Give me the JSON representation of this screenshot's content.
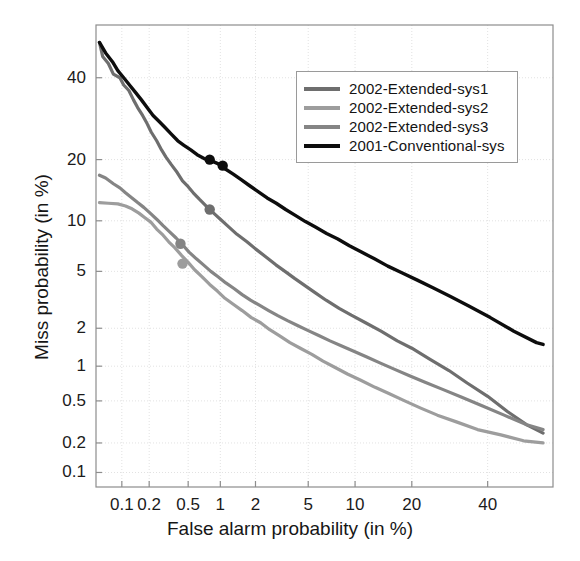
{
  "chart_data": {
    "type": "line",
    "title": "",
    "xlabel": "False alarm probability (in %)",
    "ylabel": "Miss probability (in %)",
    "scale": "normal-deviate (DET curve)",
    "grid": true,
    "legend_position": "upper-right-inside",
    "xticks": [
      "0.1",
      "0.2",
      "0.5",
      "1",
      "2",
      "5",
      "10",
      "20",
      "40"
    ],
    "xtick_values": [
      0.1,
      0.2,
      0.5,
      1,
      2,
      5,
      10,
      20,
      40
    ],
    "yticks": [
      "40",
      "20",
      "10",
      "5",
      "2",
      "1",
      "0.5",
      "0.2",
      "0.1"
    ],
    "ytick_values": [
      40,
      20,
      10,
      5,
      2,
      1,
      0.5,
      0.2,
      0.1
    ],
    "xlim": [
      0.05,
      60
    ],
    "ylim": [
      0.07,
      55
    ],
    "series": [
      {
        "name": "2002-Extended-sys1",
        "color": "#6e6e6e",
        "points": [
          [
            0.055,
            50.0
          ],
          [
            0.06,
            46.0
          ],
          [
            0.07,
            44.0
          ],
          [
            0.08,
            41.0
          ],
          [
            0.095,
            40.0
          ],
          [
            0.105,
            38.0
          ],
          [
            0.12,
            36.5
          ],
          [
            0.135,
            34.0
          ],
          [
            0.15,
            32.0
          ],
          [
            0.17,
            30.0
          ],
          [
            0.19,
            28.0
          ],
          [
            0.21,
            26.0
          ],
          [
            0.24,
            24.0
          ],
          [
            0.27,
            22.0
          ],
          [
            0.3,
            20.5
          ],
          [
            0.34,
            19.0
          ],
          [
            0.39,
            17.5
          ],
          [
            0.44,
            16.0
          ],
          [
            0.5,
            15.0
          ],
          [
            0.56,
            14.0
          ],
          [
            0.64,
            13.0
          ],
          [
            0.72,
            12.2
          ],
          [
            0.8,
            11.5
          ],
          [
            0.9,
            10.8
          ],
          [
            1.0,
            10.2
          ],
          [
            1.2,
            9.2
          ],
          [
            1.4,
            8.4
          ],
          [
            1.7,
            7.6
          ],
          [
            2.0,
            6.9
          ],
          [
            2.4,
            6.2
          ],
          [
            2.9,
            5.5
          ],
          [
            3.4,
            5.0
          ],
          [
            4.0,
            4.5
          ],
          [
            4.8,
            4.0
          ],
          [
            5.6,
            3.6
          ],
          [
            6.6,
            3.2
          ],
          [
            8.0,
            2.8
          ],
          [
            9.5,
            2.5
          ],
          [
            11.5,
            2.2
          ],
          [
            14.0,
            1.9
          ],
          [
            17.0,
            1.6
          ],
          [
            20.0,
            1.4
          ],
          [
            24.0,
            1.15
          ],
          [
            29.0,
            0.92
          ],
          [
            34.0,
            0.72
          ],
          [
            40.0,
            0.55
          ],
          [
            46.0,
            0.4
          ],
          [
            52.0,
            0.3
          ],
          [
            57.0,
            0.25
          ]
        ],
        "markers": [
          [
            0.8,
            11.5
          ]
        ]
      },
      {
        "name": "2002-Extended-sys2",
        "color": "#9d9d9d",
        "points": [
          [
            0.055,
            12.5
          ],
          [
            0.07,
            12.4
          ],
          [
            0.09,
            12.3
          ],
          [
            0.11,
            12.0
          ],
          [
            0.13,
            11.6
          ],
          [
            0.155,
            11.0
          ],
          [
            0.18,
            10.4
          ],
          [
            0.21,
            9.8
          ],
          [
            0.24,
            9.0
          ],
          [
            0.28,
            8.3
          ],
          [
            0.32,
            7.6
          ],
          [
            0.37,
            7.0
          ],
          [
            0.43,
            6.3
          ],
          [
            0.5,
            5.7
          ],
          [
            0.58,
            5.1
          ],
          [
            0.68,
            4.6
          ],
          [
            0.8,
            4.1
          ],
          [
            0.94,
            3.7
          ],
          [
            1.1,
            3.3
          ],
          [
            1.3,
            3.0
          ],
          [
            1.55,
            2.7
          ],
          [
            1.85,
            2.4
          ],
          [
            2.2,
            2.2
          ],
          [
            2.6,
            1.95
          ],
          [
            3.1,
            1.75
          ],
          [
            3.7,
            1.55
          ],
          [
            4.4,
            1.4
          ],
          [
            5.3,
            1.25
          ],
          [
            6.3,
            1.1
          ],
          [
            7.5,
            0.98
          ],
          [
            9.0,
            0.86
          ],
          [
            10.8,
            0.76
          ],
          [
            13.0,
            0.66
          ],
          [
            15.5,
            0.58
          ],
          [
            18.5,
            0.5
          ],
          [
            22.0,
            0.43
          ],
          [
            26.0,
            0.37
          ],
          [
            31.0,
            0.32
          ],
          [
            37.0,
            0.27
          ],
          [
            44.0,
            0.24
          ],
          [
            51.0,
            0.21
          ],
          [
            57.0,
            0.2
          ]
        ],
        "markers": [
          [
            0.44,
            5.6
          ]
        ]
      },
      {
        "name": "2002-Extended-sys3",
        "color": "#858585",
        "points": [
          [
            0.055,
            17.0
          ],
          [
            0.065,
            16.5
          ],
          [
            0.08,
            15.5
          ],
          [
            0.095,
            14.8
          ],
          [
            0.11,
            14.0
          ],
          [
            0.13,
            13.2
          ],
          [
            0.15,
            12.5
          ],
          [
            0.175,
            11.8
          ],
          [
            0.205,
            11.0
          ],
          [
            0.24,
            10.2
          ],
          [
            0.28,
            9.4
          ],
          [
            0.325,
            8.7
          ],
          [
            0.38,
            8.0
          ],
          [
            0.44,
            7.3
          ],
          [
            0.51,
            6.6
          ],
          [
            0.6,
            6.0
          ],
          [
            0.7,
            5.5
          ],
          [
            0.82,
            5.0
          ],
          [
            0.96,
            4.6
          ],
          [
            1.12,
            4.2
          ],
          [
            1.32,
            3.85
          ],
          [
            1.55,
            3.5
          ],
          [
            1.82,
            3.2
          ],
          [
            2.15,
            2.95
          ],
          [
            2.55,
            2.7
          ],
          [
            3.0,
            2.48
          ],
          [
            3.55,
            2.28
          ],
          [
            4.2,
            2.1
          ],
          [
            5.0,
            1.92
          ],
          [
            5.9,
            1.76
          ],
          [
            7.0,
            1.6
          ],
          [
            8.3,
            1.46
          ],
          [
            9.9,
            1.32
          ],
          [
            11.7,
            1.19
          ],
          [
            13.9,
            1.06
          ],
          [
            16.5,
            0.94
          ],
          [
            19.5,
            0.83
          ],
          [
            23.0,
            0.73
          ],
          [
            27.5,
            0.63
          ],
          [
            32.5,
            0.54
          ],
          [
            38.5,
            0.45
          ],
          [
            45.0,
            0.37
          ],
          [
            52.0,
            0.3
          ],
          [
            57.0,
            0.27
          ]
        ],
        "markers": [
          [
            0.42,
            7.4
          ]
        ]
      },
      {
        "name": "2001-Conventional-sys",
        "color": "#0d0d0d",
        "points": [
          [
            0.055,
            50.0
          ],
          [
            0.065,
            47.0
          ],
          [
            0.078,
            44.5
          ],
          [
            0.09,
            42.0
          ],
          [
            0.105,
            40.0
          ],
          [
            0.122,
            38.0
          ],
          [
            0.142,
            36.0
          ],
          [
            0.165,
            34.0
          ],
          [
            0.19,
            32.0
          ],
          [
            0.22,
            30.0
          ],
          [
            0.255,
            28.5
          ],
          [
            0.295,
            27.0
          ],
          [
            0.34,
            25.5
          ],
          [
            0.395,
            24.0
          ],
          [
            0.455,
            23.0
          ],
          [
            0.53,
            22.0
          ],
          [
            0.61,
            21.0
          ],
          [
            0.71,
            20.2
          ],
          [
            0.82,
            19.8
          ],
          [
            0.95,
            19.2
          ],
          [
            1.1,
            18.2
          ],
          [
            1.3,
            17.2
          ],
          [
            1.52,
            16.2
          ],
          [
            1.78,
            15.2
          ],
          [
            2.1,
            14.2
          ],
          [
            2.48,
            13.2
          ],
          [
            2.92,
            12.4
          ],
          [
            3.44,
            11.5
          ],
          [
            4.05,
            10.7
          ],
          [
            4.78,
            9.9
          ],
          [
            5.64,
            9.2
          ],
          [
            6.65,
            8.5
          ],
          [
            7.85,
            7.9
          ],
          [
            9.25,
            7.2
          ],
          [
            10.9,
            6.6
          ],
          [
            12.9,
            6.0
          ],
          [
            15.2,
            5.4
          ],
          [
            17.9,
            4.9
          ],
          [
            21.1,
            4.4
          ],
          [
            24.9,
            3.9
          ],
          [
            29.4,
            3.4
          ],
          [
            34.6,
            2.9
          ],
          [
            40.8,
            2.4
          ],
          [
            48.0,
            1.9
          ],
          [
            55.0,
            1.55
          ],
          [
            57.0,
            1.5
          ]
        ],
        "markers": [
          [
            0.8,
            20.0
          ],
          [
            1.05,
            18.8
          ]
        ]
      }
    ]
  },
  "axes": {
    "xlabel": "False alarm probability (in %)",
    "ylabel": "Miss probability (in %)",
    "xticks": [
      {
        "label": "0.1"
      },
      {
        "label": "0.2"
      },
      {
        "label": "0.5"
      },
      {
        "label": "1"
      },
      {
        "label": "2"
      },
      {
        "label": "5"
      },
      {
        "label": "10"
      },
      {
        "label": "20"
      },
      {
        "label": "40"
      }
    ],
    "yticks": [
      {
        "label": "40"
      },
      {
        "label": "20"
      },
      {
        "label": "10"
      },
      {
        "label": "5"
      },
      {
        "label": "2"
      },
      {
        "label": "1"
      },
      {
        "label": "0.5"
      },
      {
        "label": "0.2"
      },
      {
        "label": "0.1"
      }
    ]
  },
  "legend": {
    "items": [
      {
        "label": "2002-Extended-sys1",
        "color": "#6e6e6e"
      },
      {
        "label": "2002-Extended-sys2",
        "color": "#9d9d9d"
      },
      {
        "label": "2002-Extended-sys3",
        "color": "#858585"
      },
      {
        "label": "2001-Conventional-sys",
        "color": "#0d0d0d"
      }
    ]
  },
  "style": {
    "axis_color": "#8d8d8d",
    "grid_color": "#e2e2e2",
    "background": "#ffffff"
  }
}
